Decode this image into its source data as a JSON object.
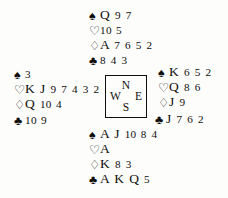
{
  "diagram": {
    "suit_order": [
      "spades",
      "hearts",
      "diamonds",
      "clubs"
    ],
    "suit_symbols": {
      "spades": "♠",
      "hearts": "♡",
      "diamonds": "♢",
      "clubs": "♣"
    },
    "compass": {
      "north": "N",
      "west": "W",
      "east": "E",
      "south": "S"
    },
    "hands": {
      "north": {
        "seat": "North",
        "spades": "Q 9 7",
        "hearts": "10 5",
        "diamonds": "A 7 6 5 2",
        "clubs": "8 4 3"
      },
      "west": {
        "seat": "West",
        "spades": "3",
        "hearts": "K J 9 7 4 3 2",
        "diamonds": "Q 10 4",
        "clubs": "10 9"
      },
      "east": {
        "seat": "East",
        "spades": "K 6 5 2",
        "hearts": "Q 8 6",
        "diamonds": "J 9",
        "clubs": "J 7 6 2"
      },
      "south": {
        "seat": "South",
        "spades": "A J 10 8 4",
        "hearts": "A",
        "diamonds": "K 8 3",
        "clubs": "A K Q 5"
      }
    }
  }
}
